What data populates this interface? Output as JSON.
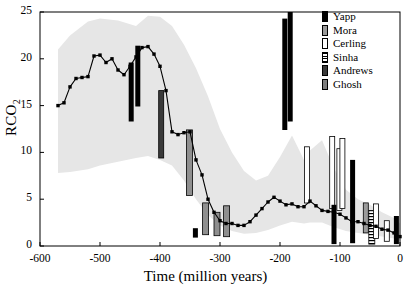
{
  "chart_data": {
    "type": "line",
    "title": "",
    "xlabel": "Time (million years)",
    "ylabel": "RCO2",
    "xlim": [
      -600,
      0
    ],
    "ylim": [
      0,
      25
    ],
    "xticks": [
      -600,
      -500,
      -400,
      -300,
      -200,
      -100,
      0
    ],
    "yticks": [
      0,
      5,
      10,
      15,
      20,
      25
    ],
    "grid": false,
    "legend_position": "top-right",
    "series": [
      {
        "name": "GEOCARB RCO2",
        "marker": "filled-square",
        "color": "#000000",
        "x": [
          -570,
          -560,
          -550,
          -540,
          -530,
          -520,
          -510,
          -500,
          -490,
          -480,
          -470,
          -460,
          -450,
          -440,
          -430,
          -420,
          -410,
          -400,
          -390,
          -380,
          -370,
          -360,
          -350,
          -340,
          -330,
          -320,
          -310,
          -300,
          -290,
          -280,
          -270,
          -260,
          -250,
          -240,
          -230,
          -220,
          -210,
          -200,
          -190,
          -180,
          -170,
          -160,
          -150,
          -140,
          -130,
          -120,
          -110,
          -100,
          -90,
          -80,
          -70,
          -60,
          -50,
          -40,
          -30,
          -20,
          -10,
          0
        ],
        "y": [
          15.0,
          15.3,
          17.0,
          17.9,
          18.0,
          18.1,
          20.3,
          20.4,
          19.6,
          20.0,
          18.8,
          18.3,
          19.2,
          20.2,
          21.2,
          21.3,
          20.5,
          19.2,
          16.6,
          12.2,
          11.9,
          12.1,
          12.2,
          9.2,
          7.6,
          5.0,
          3.6,
          2.7,
          2.4,
          2.4,
          2.2,
          2.2,
          2.6,
          3.3,
          4.0,
          4.7,
          5.2,
          4.8,
          4.4,
          4.5,
          4.2,
          4.2,
          4.8,
          4.3,
          3.8,
          3.7,
          3.6,
          3.4,
          3.0,
          2.6,
          2.6,
          2.4,
          2.2,
          2.1,
          1.8,
          1.7,
          1.4,
          1.0
        ]
      }
    ],
    "uncertainty_band": {
      "name": "GEOCARB uncertainty envelope",
      "color": "#e6e6e6",
      "x": [
        -570,
        -550,
        -520,
        -500,
        -470,
        -440,
        -420,
        -400,
        -380,
        -360,
        -340,
        -320,
        -300,
        -280,
        -260,
        -240,
        -220,
        -200,
        -180,
        -160,
        -150,
        -130,
        -110,
        -90,
        -70,
        -50,
        -30,
        -10,
        0
      ],
      "upper": [
        21.0,
        22.5,
        24.0,
        24.3,
        24.1,
        23.5,
        24.6,
        24.5,
        23.5,
        21.5,
        19.0,
        16.0,
        12.5,
        10.0,
        8.0,
        7.0,
        7.5,
        9.5,
        11.8,
        9.2,
        10.2,
        11.3,
        8.3,
        6.0,
        5.0,
        4.4,
        3.6,
        3.0,
        2.4
      ],
      "lower": [
        7.8,
        7.9,
        8.2,
        8.6,
        9.0,
        9.4,
        9.6,
        9.2,
        8.6,
        7.0,
        5.0,
        3.3,
        2.2,
        1.6,
        1.3,
        1.4,
        1.7,
        2.2,
        2.6,
        2.4,
        2.5,
        2.5,
        2.0,
        1.6,
        1.4,
        1.2,
        1.0,
        0.8,
        0.6
      ]
    },
    "proxy_error_bars": [
      {
        "source": "Yapp",
        "x": -448,
        "low": 13.3,
        "high": 19.6
      },
      {
        "source": "Yapp",
        "x": -437,
        "low": 14.9,
        "high": 21.4
      },
      {
        "source": "Andrews",
        "x": -398,
        "low": 9.4,
        "high": 16.6
      },
      {
        "source": "Ghosh",
        "x": -351,
        "low": 5.4,
        "high": 12.4
      },
      {
        "source": "Yapp",
        "x": -341,
        "low": 0.9,
        "high": 1.9
      },
      {
        "source": "Ghosh",
        "x": -324,
        "low": 1.2,
        "high": 4.6
      },
      {
        "source": "Ghosh",
        "x": -305,
        "low": 1.1,
        "high": 3.6
      },
      {
        "source": "Ghosh",
        "x": -289,
        "low": 1.0,
        "high": 4.3
      },
      {
        "source": "Yapp",
        "x": -192,
        "low": 12.4,
        "high": 24.3
      },
      {
        "source": "Yapp",
        "x": -183,
        "low": 13.3,
        "high": 25.0
      },
      {
        "source": "Cerling",
        "x": -155,
        "low": 4.6,
        "high": 10.6
      },
      {
        "source": "Cerling",
        "x": -113,
        "low": 4.0,
        "high": 11.7
      },
      {
        "source": "Yapp",
        "x": -110,
        "low": 0.2,
        "high": 4.4
      },
      {
        "source": "Cerling",
        "x": -101,
        "low": 3.8,
        "high": 10.4
      },
      {
        "source": "Cerling",
        "x": -96,
        "low": 4.0,
        "high": 11.5
      },
      {
        "source": "Yapp",
        "x": -79,
        "low": 0.3,
        "high": 9.2
      },
      {
        "source": "Mora",
        "x": -57,
        "low": 1.4,
        "high": 4.6
      },
      {
        "source": "Sinha",
        "x": -47,
        "low": 0.2,
        "high": 3.8
      },
      {
        "source": "Cerling",
        "x": -40,
        "low": 0.8,
        "high": 4.5
      },
      {
        "source": "Cerling",
        "x": -22,
        "low": 0.5,
        "high": 2.7
      },
      {
        "source": "Yapp",
        "x": -6,
        "low": 0.2,
        "high": 3.2
      }
    ]
  },
  "axes": {
    "ylabel_main": "RCO",
    "ylabel_sub": "2",
    "xlabel": "Time (million years)",
    "yticks": [
      "25",
      "20",
      "15",
      "10",
      "5",
      "0"
    ],
    "xticks": [
      "-600",
      "-500",
      "-400",
      "-300",
      "-200",
      "-100",
      "0"
    ]
  },
  "legend": {
    "items": [
      {
        "label": "Yapp",
        "swatch": "solid"
      },
      {
        "label": "Mora",
        "swatch": "gray"
      },
      {
        "label": "Cerling",
        "swatch": "open"
      },
      {
        "label": "Sinha",
        "swatch": "hatch"
      },
      {
        "label": "Andrews",
        "swatch": "dark"
      },
      {
        "label": "Ghosh",
        "swatch": "gray2"
      }
    ]
  }
}
